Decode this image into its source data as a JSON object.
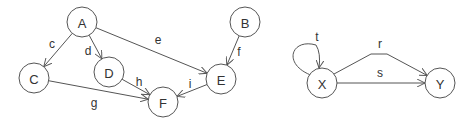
{
  "graphs": [
    {
      "name": "graph-left",
      "nodes": [
        {
          "id": "A",
          "label": "A",
          "cx": 82,
          "cy": 22,
          "r": 15
        },
        {
          "id": "B",
          "label": "B",
          "cx": 245,
          "cy": 22,
          "r": 15
        },
        {
          "id": "C",
          "label": "C",
          "cx": 34,
          "cy": 78,
          "r": 15
        },
        {
          "id": "D",
          "label": "D",
          "cx": 109,
          "cy": 72,
          "r": 15
        },
        {
          "id": "E",
          "label": "E",
          "cx": 221,
          "cy": 79,
          "r": 15
        },
        {
          "id": "F",
          "label": "F",
          "cx": 163,
          "cy": 102,
          "r": 15
        }
      ],
      "edges": [
        {
          "id": "c",
          "label": "c",
          "from": "A",
          "to": "C",
          "lx": 52,
          "ly": 44
        },
        {
          "id": "d",
          "label": "d",
          "from": "A",
          "to": "D",
          "lx": 88,
          "ly": 51
        },
        {
          "id": "e",
          "label": "e",
          "from": "A",
          "to": "E",
          "lx": 158,
          "ly": 40
        },
        {
          "id": "f",
          "label": "f",
          "from": "B",
          "to": "E",
          "lx": 239,
          "ly": 52
        },
        {
          "id": "g",
          "label": "g",
          "from": "C",
          "to": "F",
          "lx": 94,
          "ly": 103
        },
        {
          "id": "h",
          "label": "h",
          "from": "D",
          "to": "F",
          "lx": 139,
          "ly": 82
        },
        {
          "id": "i",
          "label": "i",
          "from": "E",
          "to": "F",
          "lx": 190,
          "ly": 84
        }
      ]
    },
    {
      "name": "graph-right",
      "nodes": [
        {
          "id": "X",
          "label": "X",
          "cx": 322,
          "cy": 83,
          "r": 15
        },
        {
          "id": "Y",
          "label": "Y",
          "cx": 440,
          "cy": 83,
          "r": 15
        }
      ],
      "edges": [
        {
          "id": "t",
          "label": "t",
          "from": "X",
          "to": "X",
          "lx": 317,
          "ly": 37,
          "type": "self-loop"
        },
        {
          "id": "r",
          "label": "r",
          "from": "X",
          "to": "Y",
          "lx": 380,
          "ly": 44,
          "type": "curved"
        },
        {
          "id": "s",
          "label": "s",
          "from": "X",
          "to": "Y",
          "lx": 380,
          "ly": 73,
          "type": "straight"
        }
      ]
    }
  ]
}
